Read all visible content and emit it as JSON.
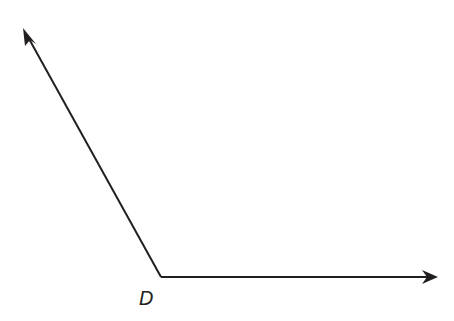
{
  "diagram": {
    "type": "angle",
    "vertex_label": "D",
    "vertex": [
      161,
      277
    ],
    "ray1_end": [
      24,
      30
    ],
    "ray2_end": [
      437,
      277
    ],
    "stroke_color": "#231f20"
  }
}
